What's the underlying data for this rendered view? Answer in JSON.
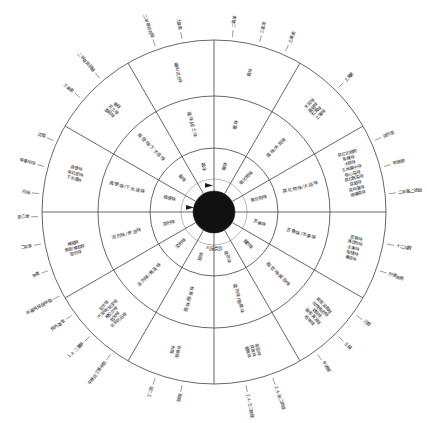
{
  "figure": {
    "type": "odor-wheel-diagram",
    "title": "气味类别",
    "hub_label": "气味类别",
    "language": "zh-CN",
    "ring_count": 3,
    "sector_count": 12,
    "colors": {
      "line": "#4a4a4a",
      "hub": "#111111",
      "hub_ring": "#9a9a9a",
      "text": "#1f1f1f",
      "background": "#ffffff"
    }
  },
  "chart_data": {
    "type": "pie",
    "title": "气味类别",
    "xlabel": "",
    "ylabel": "",
    "categories": [
      "霉味",
      "氧化物味",
      "腐化物味/大蒜味",
      "芳香味/水果味",
      "脂肪味/腐败味",
      "腐败味/酸臭味",
      "脂肪味/腐败味",
      "酸味/酸臭味",
      "溶剂味/焦油味",
      "溶剂味/焦油味",
      "粪便味/下水道味",
      "霉味/泥土味"
    ],
    "values": [
      30,
      30,
      30,
      30,
      30,
      30,
      30,
      30,
      30,
      30,
      30,
      30
    ],
    "legend_position": "none",
    "grid": false
  },
  "sectors": [
    {
      "index": 0,
      "angle_start": -90,
      "angle_end": -60,
      "inner": "霉味",
      "middle": "霉味",
      "outer": "霉味",
      "external": [
        "二氯苯",
        "三氯苯",
        "土臭素"
      ]
    },
    {
      "index": 1,
      "angle_start": -60,
      "angle_end": -30,
      "inner": "氧化物味",
      "middle": "腐味/木耳味",
      "outer": [
        "木耳味",
        "菌菇味",
        "松茸味",
        "土壤味"
      ],
      "external": [
        "土臭素"
      ]
    },
    {
      "index": 2,
      "angle_start": -30,
      "angle_end": 0,
      "inner": "氧化物味",
      "middle": "腐化物味/大蒜味",
      "outer": [
        "腐烂的植物",
        "鱼腥味",
        "大蒜味",
        "玉米罐头味",
        "卷心菜味",
        "腐烂蔬菜味",
        "臭鼬味",
        "臭鸡蛋味",
        "硫磺清味"
      ],
      "external": [
        "硫化氢",
        "甲硫醇",
        "二甲基二硫醚"
      ]
    },
    {
      "index": 3,
      "angle_start": 0,
      "angle_end": 30,
      "inner": "芳香味",
      "middle": "芳香味/水果味",
      "outer": [
        "肥皂味",
        "清洁剂味",
        "水果味",
        "柑橘味",
        "青草味"
      ],
      "external": [
        "十二烷醛",
        "柠檬油精"
      ]
    },
    {
      "index": 4,
      "angle_start": 30,
      "angle_end": 60,
      "inner": "脂肪味",
      "middle": "脂肪味/腐败味",
      "outer": [
        "腐败油脂味",
        "动物脂肪味",
        "蜡烛味",
        "酸败黄油味",
        "哈喇味"
      ],
      "external": [
        "己醛",
        "壬醛",
        "辛烯醇"
      ]
    },
    {
      "index": 5,
      "angle_start": 60,
      "angle_end": 90,
      "inner": "腐败味",
      "middle": "腐败味/酸臭味",
      "outer": [
        "脂肪味",
        "腐败味",
        "酸败味"
      ],
      "external": [
        "2,4-癸二烯醛",
        "2,4-壬二烯醛"
      ]
    },
    {
      "index": 6,
      "angle_start": 90,
      "angle_end": 120,
      "inner": "酸味",
      "middle": "酸味/酸臭味",
      "outer": [
        "酸味",
        "酸臭味"
      ],
      "external": [
        "醋酸",
        "丁二酮"
      ]
    },
    {
      "index": 7,
      "angle_start": 120,
      "angle_end": 150,
      "inner": "溶剂味",
      "middle": "溶剂味/焦油味",
      "outer": [
        "胶水味",
        "汽油味/油漆味",
        "橡胶点味",
        "鞋油味",
        "化学药品味"
      ],
      "external": [
        "甲基异丁基甲酮",
        "1,4-二氯苯",
        "异丙基苯"
      ]
    },
    {
      "index": 8,
      "angle_start": 150,
      "angle_end": 180,
      "inner": "溶剂味",
      "middle": "溶剂味/焦油味",
      "outer": [
        "樟脑味",
        "焦油/橡胶味",
        "溶剂味"
      ],
      "external": [
        "甲基丙烯酸甲酯",
        "甲苯",
        "二甲苯",
        "苯乙烯"
      ]
    },
    {
      "index": 9,
      "angle_start": 180,
      "angle_end": 210,
      "inner": "粪便味",
      "middle": "粪便味/下水道味",
      "outer": [
        "粪便味",
        "有机肥味",
        "下水道味"
      ],
      "external": [
        "吲哚",
        "甲基吲哚",
        "戊酸"
      ]
    },
    {
      "index": 10,
      "angle_start": 210,
      "angle_end": 240,
      "inner": "霉味",
      "middle": "粪便味/下水道味",
      "outer": [
        "霉味",
        "泥土味",
        "蘑菇味"
      ],
      "external": [
        "土臭素",
        "二甲基异莰醇"
      ]
    },
    {
      "index": 11,
      "angle_start": 240,
      "angle_end": 270,
      "inner": "霉味",
      "middle": "霉味/泥土味",
      "outer": [
        "霉味/泥土味"
      ],
      "external": [
        "二甲基异莰醇",
        "土臭素"
      ]
    }
  ]
}
